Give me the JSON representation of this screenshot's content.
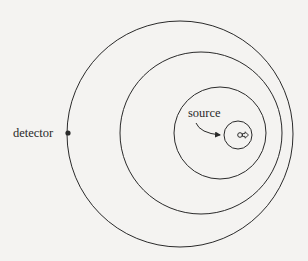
{
  "diagram": {
    "labels": {
      "detector": "detector",
      "source": "source"
    },
    "colors": {
      "background": "#f4f3f1",
      "stroke": "#2a2a2a"
    },
    "wavefronts": [
      {
        "cx": 180,
        "cy": 134,
        "r": 113
      },
      {
        "cx": 201,
        "cy": 133,
        "r": 81
      },
      {
        "cx": 220,
        "cy": 133,
        "r": 46
      },
      {
        "cx": 238,
        "cy": 135,
        "r": 14
      }
    ],
    "detector_point": {
      "x": 68,
      "y": 133
    },
    "source_point": {
      "x": 237,
      "y": 135
    },
    "source_direction": "right"
  }
}
